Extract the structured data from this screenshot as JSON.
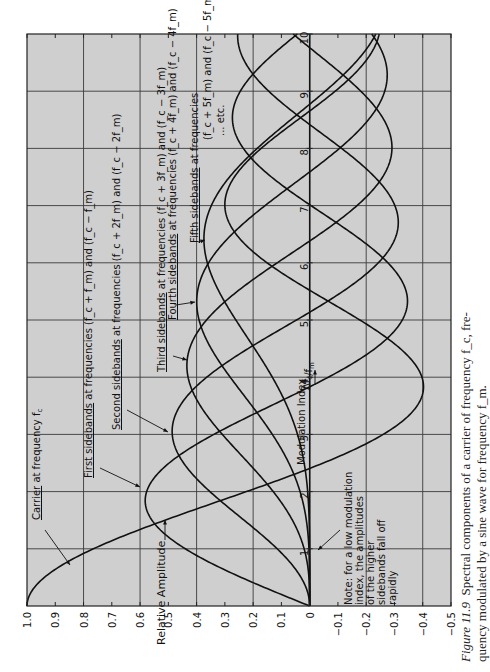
{
  "chart_data": {
    "type": "line",
    "orientation": "rotated-90-ccw",
    "xlabel": "Modulation Index  Δfc / fm",
    "ylabel": "Relative Amplitude",
    "xlim": [
      0,
      10
    ],
    "ylim": [
      -0.5,
      1.0
    ],
    "x_ticks": [
      1,
      2,
      3,
      4,
      5,
      6,
      7,
      8,
      9,
      10
    ],
    "y_ticks": [
      "1.0",
      "0.9",
      "0.8",
      "0.7",
      "0.6",
      "0.5",
      "0.4",
      "0.3",
      "0.2",
      "0.1",
      "0",
      "-0.1",
      "-0.2",
      "-0.3",
      "-0.4",
      "-0.5"
    ],
    "grid": true,
    "x": [
      0,
      1,
      2,
      3,
      4,
      5,
      6,
      7,
      8,
      9,
      10
    ],
    "series": [
      {
        "name": "Carrier at frequency fc",
        "order": 0,
        "values": [
          1.0,
          0.77,
          0.22,
          -0.26,
          -0.4,
          -0.18,
          0.15,
          0.3,
          0.17,
          -0.09,
          -0.25
        ]
      },
      {
        "name": "First sidebands at frequencies (fc + fm) and (fc - fm)",
        "order": 1,
        "values": [
          0.0,
          0.44,
          0.58,
          0.34,
          -0.07,
          -0.33,
          -0.28,
          0.0,
          0.23,
          0.25,
          0.04
        ]
      },
      {
        "name": "Second sidebands at frequencies (fc + 2fm) and (fc - 2fm)",
        "order": 2,
        "values": [
          0.0,
          0.11,
          0.35,
          0.49,
          0.36,
          0.05,
          -0.24,
          -0.3,
          -0.11,
          0.14,
          0.25
        ]
      },
      {
        "name": "Third sidebands at frequencies (fc + 3fm) and (fc - 3fm)",
        "order": 3,
        "values": [
          0.0,
          0.02,
          0.13,
          0.31,
          0.43,
          0.36,
          0.11,
          -0.17,
          -0.29,
          -0.18,
          0.06
        ]
      },
      {
        "name": "Fourth sidebands at frequencies (fc + 4fm) and (fc - 4fm)",
        "order": 4,
        "values": [
          0.0,
          0.0,
          0.03,
          0.13,
          0.28,
          0.39,
          0.36,
          0.16,
          -0.11,
          -0.27,
          -0.22
        ]
      },
      {
        "name": "Fifth sidebands at frequencies (fc + 5fm) and (fc - 5fm)",
        "order": 5,
        "values": [
          0.0,
          0.0,
          0.01,
          0.04,
          0.13,
          0.26,
          0.36,
          0.35,
          0.19,
          -0.06,
          -0.23
        ]
      }
    ],
    "annotations": [
      {
        "text": "Carrier at frequency f_c",
        "underline": "Carrier"
      },
      {
        "text": "First sidebands at frequencies (f_c + f_m) and (f_c - f_m)",
        "underline": "First sidebands"
      },
      {
        "text": "Second sidebands at frequencies (f_c + 2f_m) and (f_c - 2f_m)",
        "underline": "Second sidebands"
      },
      {
        "text": "Third sidebands at frequencies (f_c + 3f_m) and (f_c - 3f_m)",
        "underline": "Third sidebands"
      },
      {
        "text": "Fourth sidebands at frequencies (f_c + 4f_m) and (f_c - 4f_m)",
        "underline": "Fourth sidebands"
      },
      {
        "text": "Fifth sidebands at frequencies",
        "underline": "Fifth sidebands"
      },
      {
        "text": "(f_c + 5f_m) and (f_c - 5f_m)"
      },
      {
        "text": "... etc."
      },
      {
        "text": "Note: for a low modulation index, the amplitudes of the higher sidebands fall off rapidly"
      }
    ],
    "legend": "none (inline annotations with arrows)"
  },
  "labels": {
    "ylabel": "Relative Amplitude",
    "xlabel": "Modulation Index",
    "xlabel_frac_num": "Δf",
    "xlabel_frac_num_sub": "c",
    "xlabel_frac_den": "f",
    "xlabel_frac_den_sub": "m",
    "carrier_u": "Carrier",
    "carrier_rest": " at frequency f",
    "carrier_sub": "c",
    "first_u": "First sidebands",
    "first_rest": " at frequencies (f_c + f_m) and (f_c − f_m)",
    "second_u": "Second sidebands",
    "second_rest": " at frequencies (f_c + 2f_m) and (f_c − 2f_m)",
    "third_u": "Third sidebands",
    "third_rest": " at frequencies (f_c + 3f_m) and (f_c − 3f_m)",
    "fourth_u": "Fourth sidebands",
    "fourth_rest": " at frequencies (f_c + 4f_m) and (f_c − 4f_m)",
    "fifth_u": "Fifth sidebands",
    "fifth_rest": " at frequencies",
    "fifth_line2": "(f_c + 5f_m) and (f_c − 5f_m)",
    "etc": "... etc.",
    "note_1": "Note: for a low modulation",
    "note_2": "index, the amplitudes",
    "note_3": "of the higher",
    "note_4": "sidebands fall off",
    "note_5": "rapidly"
  },
  "caption": {
    "figure_label": "Figure 11.9",
    "line1": "Spectral components of a carrier of frequency f_c, fre-",
    "line2": "quency modulated by a sine wave for frequency f_m."
  },
  "colors": {
    "plot_bg": "#cfcfcf",
    "grid": "#3a3a3a",
    "curve": "#111111",
    "page_bg": "#ffffff"
  }
}
